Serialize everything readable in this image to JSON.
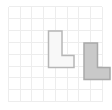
{
  "canvas": {
    "width": 112,
    "height": 110,
    "background_color": "#ffffff"
  },
  "grid": {
    "line_color": "#ededed",
    "line_width": 1,
    "columns": 8,
    "rows": 8,
    "cell_width": 11.7,
    "cell_height": 11.9,
    "origin_x": 8.5,
    "origin_y": 6.5,
    "extent_x": 102.1,
    "extent_y": 101.7
  },
  "shapes": [
    {
      "id": "shape-1",
      "name": "l-shape-light",
      "label": "L",
      "fill_color": "#f8f8f8",
      "stroke_color": "#b6b6b6",
      "stroke_width": 1.5,
      "points": "48.5,31 62,31 62,55.5 74,55.5 74,67.5 48.5,67.5",
      "bbox": {
        "x": 48.5,
        "y": 31,
        "width": 25.5,
        "height": 36.5
      }
    },
    {
      "id": "shape-2",
      "name": "l-shape-gray",
      "label": "L",
      "fill_color": "#c9c9c9",
      "stroke_color": "#a9a9a9",
      "stroke_width": 1.5,
      "points": "84,43 97.5,43 97.5,67.5 110,67.5 110,79.5 84,79.5",
      "bbox": {
        "x": 84,
        "y": 43,
        "width": 26,
        "height": 36.5
      }
    }
  ]
}
